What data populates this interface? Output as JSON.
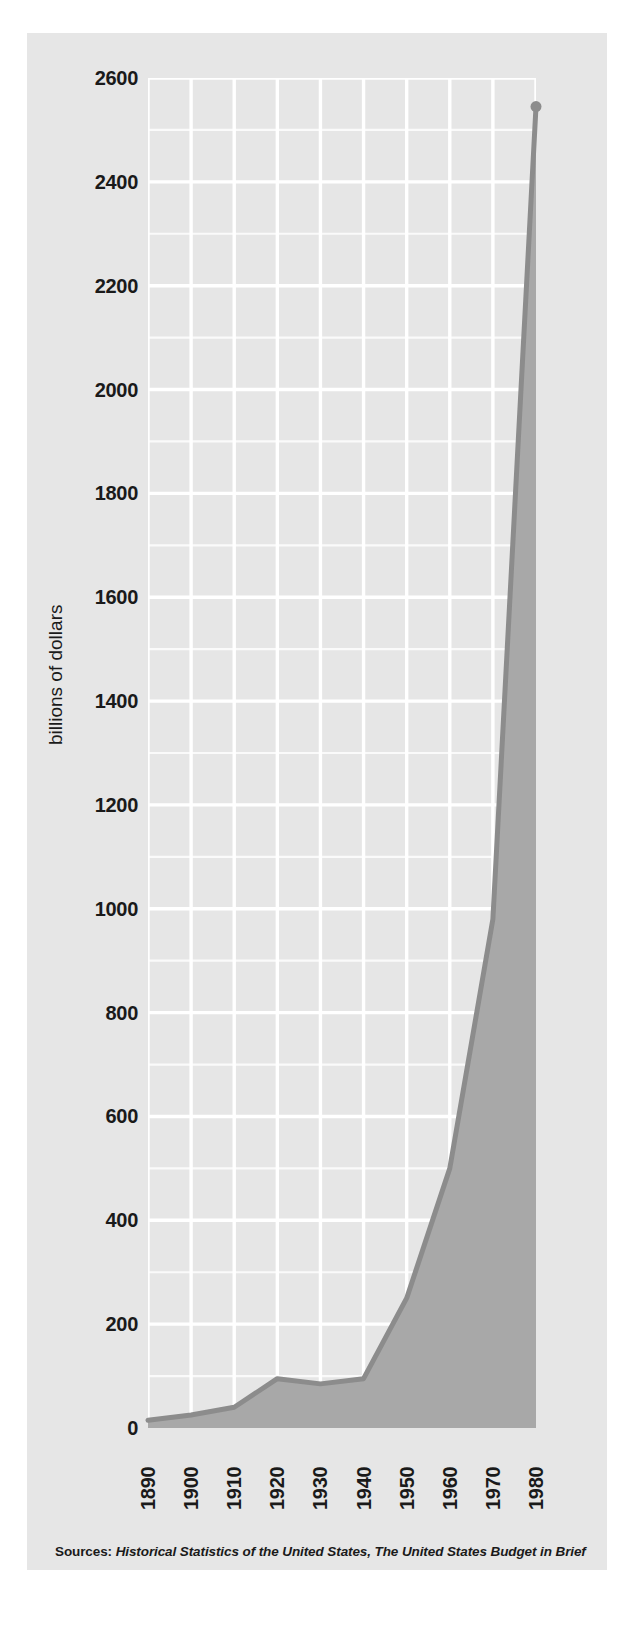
{
  "chart_data": {
    "type": "area",
    "title": "",
    "subtitle": "",
    "xlabel": "",
    "ylabel": "billions of dollars",
    "x": [
      1890,
      1900,
      1910,
      1920,
      1930,
      1940,
      1950,
      1960,
      1970,
      1980
    ],
    "categories": [
      "1890",
      "1900",
      "1910",
      "1920",
      "1930",
      "1940",
      "1950",
      "1960",
      "1970",
      "1980"
    ],
    "values": [
      15,
      25,
      40,
      95,
      85,
      95,
      250,
      500,
      980,
      2545
    ],
    "series": [
      {
        "name": "federal budget outlays",
        "values": [
          15,
          25,
          40,
          95,
          85,
          95,
          250,
          500,
          980,
          2545
        ]
      }
    ],
    "xlim": [
      1890,
      1980
    ],
    "ylim": [
      0,
      2600
    ],
    "ytick_labels": [
      "0",
      "200",
      "400",
      "600",
      "800",
      "1000",
      "1200",
      "1400",
      "1600",
      "1800",
      "2000",
      "2200",
      "2400",
      "2600"
    ],
    "ytick_values": [
      0,
      200,
      400,
      600,
      800,
      1000,
      1200,
      1400,
      1600,
      1800,
      2000,
      2200,
      2400,
      2600
    ],
    "xtick_labels": [
      "1890",
      "1900",
      "1910",
      "1920",
      "1930",
      "1940",
      "1950",
      "1960",
      "1970",
      "1980"
    ],
    "grid": true,
    "grid_color": "#ffffff",
    "minor_grid": true,
    "legend": "none",
    "line_color": "#8c8c8c",
    "fill_color": "#a8a8a8",
    "panel_color": "#e6e6e6",
    "text_color": "#1a1a1a"
  },
  "source": {
    "label": "Sources:",
    "titles": "Historical Statistics of the United States, The United States Budget in Brief"
  }
}
